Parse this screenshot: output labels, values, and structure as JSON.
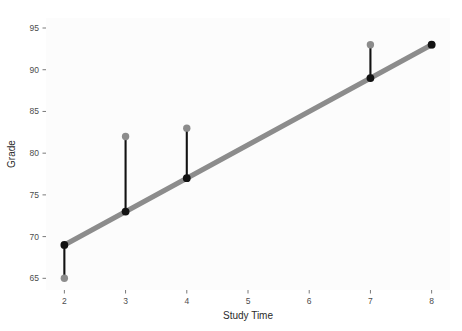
{
  "chart_data": {
    "type": "scatter",
    "title": "",
    "subtitle": "",
    "xlabel": "Study Time",
    "ylabel": "Grade",
    "xlim": [
      1.7,
      8.3
    ],
    "ylim": [
      63.6,
      96.2
    ],
    "xticks": [
      2,
      3,
      4,
      5,
      6,
      7,
      8
    ],
    "xtick_labels": [
      "2",
      "3",
      "4",
      "5",
      "6",
      "7",
      "8"
    ],
    "yticks": [
      65,
      70,
      75,
      80,
      85,
      90,
      95
    ],
    "ytick_labels": [
      "65",
      "70",
      "75",
      "80",
      "85",
      "90",
      "95"
    ],
    "grid": false,
    "legend": "none",
    "x": [
      2,
      3,
      4,
      7,
      8
    ],
    "series": [
      {
        "name": "Observed Grade",
        "role": "observed-points",
        "marker": "circle",
        "color": "#8c8c8c",
        "values": [
          65,
          82,
          83,
          93,
          93
        ]
      },
      {
        "name": "Fitted Grade",
        "role": "fitted-points",
        "marker": "circle",
        "color": "#121212",
        "values": [
          69,
          73,
          77,
          89,
          93
        ]
      }
    ],
    "residuals": [
      -4,
      9,
      6,
      4,
      0
    ],
    "regression_line": {
      "name": "Least squares fit",
      "color": "#8c8c8c",
      "x_start": 2,
      "y_start": 69,
      "x_end": 8,
      "y_end": 93,
      "slope": 4,
      "intercept": 61
    },
    "residual_segments": [
      {
        "x": 2,
        "y_from": 69,
        "y_to": 65
      },
      {
        "x": 3,
        "y_from": 73,
        "y_to": 82
      },
      {
        "x": 4,
        "y_from": 77,
        "y_to": 83
      },
      {
        "x": 7,
        "y_from": 89,
        "y_to": 93
      },
      {
        "x": 8,
        "y_from": 93,
        "y_to": 93
      }
    ]
  },
  "colors": {
    "panel_background": "#fcfcfc",
    "page_background": "#ffffff",
    "regression_line": "#8c8c8c",
    "observed_point": "#8c8c8c",
    "fitted_point": "#121212",
    "residual_segment": "#121212",
    "tick_mark": "#7a7a7a",
    "tick_label": "#4d4d4d",
    "axis_title": "#2b2b2b"
  }
}
